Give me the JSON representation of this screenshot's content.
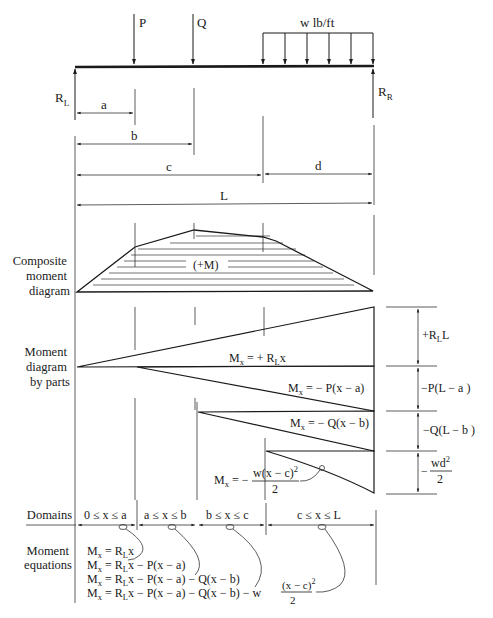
{
  "loads": {
    "point_load_1": "P",
    "point_load_2": "Q",
    "distributed_load": "w lb/ft",
    "reaction_left": "R",
    "reaction_left_sub": "L",
    "reaction_right": "R",
    "reaction_right_sub": "R"
  },
  "dimensions": {
    "a": "a",
    "b": "b",
    "c": "c",
    "d": "d",
    "L": "L"
  },
  "composite": {
    "label_lines": [
      "Composite",
      "moment",
      "diagram"
    ],
    "sign_label": "(+M)"
  },
  "parts": {
    "label_lines": [
      "Moment",
      "diagram",
      "by parts"
    ],
    "eq_RL": {
      "M": "M",
      "sub": "x",
      "rhs": " = + R",
      "rhs_sub": "L",
      "rhs_tail": "x"
    },
    "eq_P": {
      "M": "M",
      "sub": "x",
      "rhs": " = − P(x − a)"
    },
    "eq_Q": {
      "M": "M",
      "sub": "x",
      "rhs": " = − Q(x − b)"
    },
    "eq_w": {
      "M": "M",
      "sub": "x",
      "rhs": " = −",
      "num": "w(x − c)",
      "num_sup": "2",
      "den": "2"
    },
    "side_labels": {
      "RL": {
        "pre": "+R",
        "sub": "L",
        "post": "L"
      },
      "P": "−P(L − a )",
      "Q": "−Q(L − b )",
      "w": {
        "pre": "−",
        "num": "wd",
        "sup": "2",
        "den": "2"
      }
    }
  },
  "domains": {
    "label": "Domains",
    "items": [
      "0 ≤ x ≤ a",
      "a ≤ x ≤ b",
      "b ≤ x ≤ c",
      "c ≤ x ≤ L"
    ]
  },
  "moment_equations": {
    "label_lines": [
      "Moment",
      "equations"
    ],
    "lines": [
      {
        "M": "M",
        "sub": "x",
        "rhs": " = R",
        "rsub": "L",
        "tail": "x"
      },
      {
        "M": "M",
        "sub": "x",
        "rhs": " = R",
        "rsub": "L",
        "tail": "x − P(x − a)"
      },
      {
        "M": "M",
        "sub": "x",
        "rhs": " = R",
        "rsub": "L",
        "tail": "x − P(x − a) − Q(x − b)"
      },
      {
        "M": "M",
        "sub": "x",
        "rhs": " = R",
        "rsub": "L",
        "tail": "x − P(x − a) − Q(x − b) − w",
        "num": "(x − c)",
        "num_sup": "2",
        "den": "2"
      }
    ]
  }
}
